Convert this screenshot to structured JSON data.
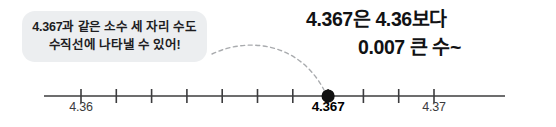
{
  "bubble": {
    "line1": "4.367과 같은 소수 세 자리 수도",
    "line2": "수직선에 나타낼 수 있어!",
    "bg_color": "#eceef0"
  },
  "callout": {
    "line1": "4.367은 4.36보다",
    "line2": "0.007 큰 수~",
    "text_color": "#111214"
  },
  "chart_data": {
    "type": "line",
    "title": "",
    "xlabel": "",
    "ylabel": "",
    "axis_min": 4.36,
    "axis_max": 4.37,
    "tick_step": 0.001,
    "tick_count": 11,
    "tick_values": [
      4.36,
      4.361,
      4.362,
      4.363,
      4.364,
      4.365,
      4.366,
      4.367,
      4.368,
      4.369,
      4.37
    ],
    "labeled_ticks": [
      {
        "value": 4.36,
        "label": "4.36",
        "highlight": false
      },
      {
        "value": 4.37,
        "label": "4.37",
        "highlight": false
      }
    ],
    "marked_point": {
      "value": 4.367,
      "label": "4.367",
      "highlight": true,
      "marker": "filled-circle",
      "color": "#111111"
    },
    "line_color": "#3c3c3e",
    "grid": false,
    "legend": "none",
    "annotation": "4.367은 4.36보다 0.007 큰 수~"
  },
  "connector": {
    "style": "dashed-arc",
    "color": "#a9abae",
    "from": "speech-bubble",
    "to": "marked-point"
  }
}
